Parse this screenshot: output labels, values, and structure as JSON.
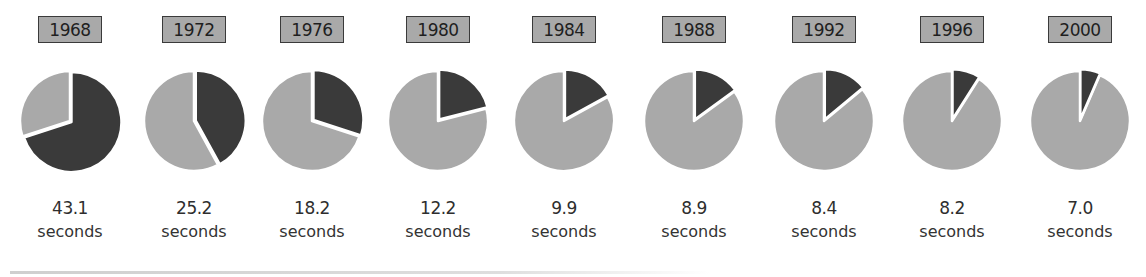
{
  "colors": {
    "dark_slice": "#3a3a3a",
    "light_slice": "#a9a9a9",
    "year_box_fill": "#a9a9a9",
    "year_box_border": "#3a3a3a"
  },
  "unit_label": "seconds",
  "columns": [
    {
      "year": "1968",
      "value": "43.1",
      "unit": "seconds",
      "dark_fraction": 0.7,
      "cx": 70
    },
    {
      "year": "1972",
      "value": "25.2",
      "unit": "seconds",
      "dark_fraction": 0.42,
      "cx": 194
    },
    {
      "year": "1976",
      "value": "18.2",
      "unit": "seconds",
      "dark_fraction": 0.3,
      "cx": 312
    },
    {
      "year": "1980",
      "value": "12.2",
      "unit": "seconds",
      "dark_fraction": 0.21,
      "cx": 438
    },
    {
      "year": "1984",
      "value": "9.9",
      "unit": "seconds",
      "dark_fraction": 0.17,
      "cx": 564
    },
    {
      "year": "1988",
      "value": "8.9",
      "unit": "seconds",
      "dark_fraction": 0.15,
      "cx": 694
    },
    {
      "year": "1992",
      "value": "8.4",
      "unit": "seconds",
      "dark_fraction": 0.14,
      "cx": 824
    },
    {
      "year": "1996",
      "value": "8.2",
      "unit": "seconds",
      "dark_fraction": 0.09,
      "cx": 952
    },
    {
      "year": "2000",
      "value": "7.0",
      "unit": "seconds",
      "dark_fraction": 0.065,
      "cx": 1080
    }
  ],
  "chart_data": {
    "type": "pie",
    "title": "",
    "categories": [
      "1968",
      "1972",
      "1976",
      "1980",
      "1984",
      "1988",
      "1992",
      "1996",
      "2000"
    ],
    "values": [
      43.1,
      25.2,
      18.2,
      12.2,
      9.9,
      8.9,
      8.4,
      8.2,
      7.0
    ],
    "value_labels": [
      "43.1 seconds",
      "25.2 seconds",
      "18.2 seconds",
      "12.2 seconds",
      "9.9 seconds",
      "8.9 seconds",
      "8.4 seconds",
      "8.2 seconds",
      "7.0 seconds"
    ],
    "series": [
      {
        "name": "dark slice (approx. fraction of pie)",
        "values": [
          0.7,
          0.42,
          0.3,
          0.21,
          0.17,
          0.15,
          0.14,
          0.09,
          0.065
        ]
      }
    ],
    "unit": "seconds",
    "layout": {
      "pies_in_row": 9,
      "year_label_position": "above, boxed",
      "value_label_position": "below",
      "grid": false,
      "legend": "none"
    }
  }
}
